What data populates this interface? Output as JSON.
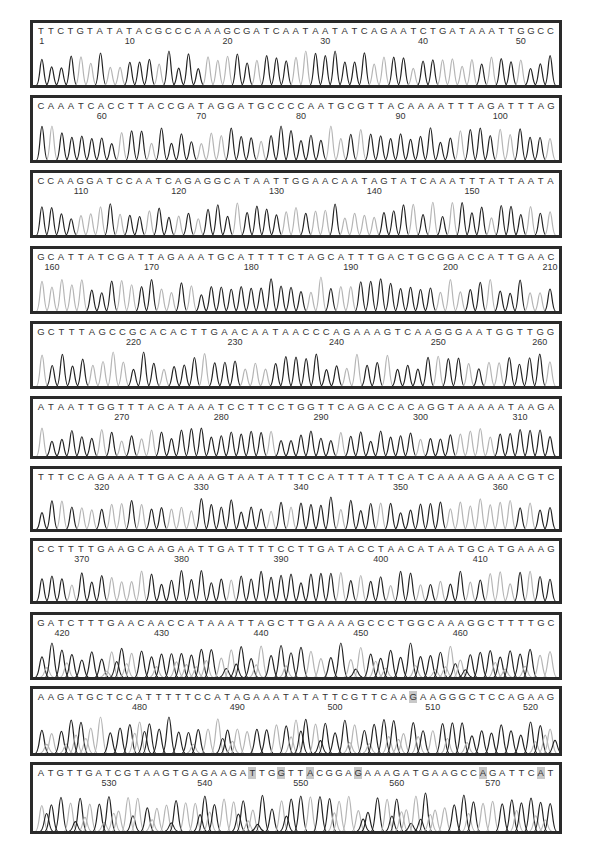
{
  "chart_data": {
    "type": "line",
    "title": "",
    "xlabel": "",
    "ylabel": "",
    "grid": false,
    "legend": null,
    "highlight_color": "#c8c8c8",
    "trace_colors": {
      "dark": "#222222",
      "light": "#b5b5b5"
    },
    "panels": [
      {
        "sequence": "TTCTGTATATACGCCCAAAGCGATCAATAATATCAGAATCTGATAAATTGGCC",
        "ticks": [
          1,
          10,
          20,
          30,
          40,
          50
        ],
        "start": 1,
        "highlights": []
      },
      {
        "sequence": "CAAATCACCTTACCGATAGGATGCCCCAATGCGTTACAAAATTTAGATTTAG",
        "ticks": [
          60,
          70,
          80,
          90,
          100
        ],
        "start": 54,
        "highlights": []
      },
      {
        "sequence": "CCAAGGATCCAATCAGAGGCATAATTGGAACAATAGTATCAAATTTATTAATA",
        "ticks": [
          110,
          120,
          130,
          140,
          150
        ],
        "start": 106,
        "highlights": []
      },
      {
        "sequence": "GCATTATCGATTAGAAATGCATTTTCTAGCATTTGACTGCGGACCATTGAAC",
        "ticks": [
          160,
          170,
          180,
          190,
          200,
          210
        ],
        "start": 159,
        "highlights": []
      },
      {
        "sequence": "GCTTTAGCCGCACACTTGAACAATAACCCAGAAAGTCAAGGGAATGGTTGG",
        "ticks": [
          220,
          230,
          240,
          250,
          260
        ],
        "start": 211,
        "highlights": []
      },
      {
        "sequence": "ATAATTGGTTTACATAAATCCTTCCTGGTTCAGACCACAGGTAAAAATAAGA",
        "ticks": [
          270,
          280,
          290,
          300,
          310
        ],
        "start": 262,
        "highlights": []
      },
      {
        "sequence": "TTTCCAGAAATTGACAAAGTAATATTTCCATTTATTCATCAAAAGAAACGTC",
        "ticks": [
          320,
          330,
          340,
          350,
          360
        ],
        "start": 314,
        "highlights": []
      },
      {
        "sequence": "CCTTTTGAAGCAAGAATTGATTTTCCTTGATACCTAACATAATGCATGAAAG",
        "ticks": [
          370,
          380,
          390,
          400,
          410
        ],
        "start": 366,
        "highlights": []
      },
      {
        "sequence": "GATCTTTGAACAACCATAAATTAGCTTGAAAAGCCCTGGCAAAGGCTTTTGC",
        "ticks": [
          420,
          430,
          440,
          450,
          460
        ],
        "start": 418,
        "highlights": []
      },
      {
        "sequence": "AAGATGCTCCATTTTTCCATAGAAATATATTCGTTCAAGAAGGGCTCCAGAAG",
        "ticks": [
          480,
          490,
          500,
          510,
          520
        ],
        "start": 470,
        "highlights": [
          38
        ]
      },
      {
        "sequence": "ATGTTGATCGTAAGTGAGAAGATTGGTTACGGAGAAAGATGAAGCCAGATTCAT",
        "ticks": [
          530,
          540,
          550,
          560,
          570
        ],
        "start": 523,
        "highlights": [
          22,
          25,
          28,
          33,
          46,
          52
        ]
      }
    ]
  }
}
